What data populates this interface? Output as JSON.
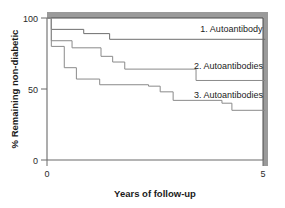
{
  "chart_data": {
    "type": "line",
    "subtype": "kaplan-meier-step",
    "title": "",
    "xlabel": "Years of follow-up",
    "ylabel": "% Remaining non-diabetic",
    "xlim": [
      0,
      5
    ],
    "ylim": [
      0,
      100
    ],
    "xticks": [
      0,
      5
    ],
    "xticklabels": [
      "0",
      "5"
    ],
    "yticks": [
      0,
      50,
      100
    ],
    "yticklabels": [
      "0",
      "50",
      "100"
    ],
    "grid": false,
    "legend_position": "inline-right",
    "series": [
      {
        "name": "1. Autoantibody",
        "label": "1. Autoantibody",
        "color": "#6e6e6e",
        "final_value": 85,
        "steps": [
          {
            "x": 0.0,
            "y": 100
          },
          {
            "x": 0.1,
            "y": 100
          },
          {
            "x": 0.1,
            "y": 92
          },
          {
            "x": 0.85,
            "y": 92
          },
          {
            "x": 0.85,
            "y": 89
          },
          {
            "x": 1.45,
            "y": 89
          },
          {
            "x": 1.45,
            "y": 85
          },
          {
            "x": 5.05,
            "y": 85
          }
        ]
      },
      {
        "name": "2. Autoantibodies",
        "label": "2. Autoantibodies",
        "color": "#8a8a8a",
        "final_value": 56,
        "steps": [
          {
            "x": 0.0,
            "y": 100
          },
          {
            "x": 0.1,
            "y": 100
          },
          {
            "x": 0.1,
            "y": 84
          },
          {
            "x": 0.58,
            "y": 84
          },
          {
            "x": 0.58,
            "y": 79
          },
          {
            "x": 1.25,
            "y": 79
          },
          {
            "x": 1.25,
            "y": 73
          },
          {
            "x": 1.52,
            "y": 73
          },
          {
            "x": 1.52,
            "y": 69
          },
          {
            "x": 1.8,
            "y": 69
          },
          {
            "x": 1.8,
            "y": 64
          },
          {
            "x": 3.45,
            "y": 64
          },
          {
            "x": 3.45,
            "y": 56
          },
          {
            "x": 5.05,
            "y": 56
          }
        ]
      },
      {
        "name": "3. Autoantibodies",
        "label": "3. Autoantibodies",
        "color": "#8a8a8a",
        "final_value": 35,
        "steps": [
          {
            "x": 0.0,
            "y": 100
          },
          {
            "x": 0.1,
            "y": 100
          },
          {
            "x": 0.1,
            "y": 80
          },
          {
            "x": 0.4,
            "y": 80
          },
          {
            "x": 0.4,
            "y": 65
          },
          {
            "x": 0.68,
            "y": 65
          },
          {
            "x": 0.68,
            "y": 57
          },
          {
            "x": 1.22,
            "y": 57
          },
          {
            "x": 1.22,
            "y": 53
          },
          {
            "x": 2.35,
            "y": 53
          },
          {
            "x": 2.35,
            "y": 52
          },
          {
            "x": 2.62,
            "y": 52
          },
          {
            "x": 2.62,
            "y": 48
          },
          {
            "x": 2.92,
            "y": 48
          },
          {
            "x": 2.92,
            "y": 42
          },
          {
            "x": 4.05,
            "y": 42
          },
          {
            "x": 4.05,
            "y": 40
          },
          {
            "x": 4.28,
            "y": 40
          },
          {
            "x": 4.28,
            "y": 35
          },
          {
            "x": 5.05,
            "y": 35
          }
        ]
      }
    ],
    "annotations": [
      {
        "text": "1. Autoantibody",
        "x": 3.55,
        "y": 90
      },
      {
        "text": "2. Autoantibodies",
        "x": 3.4,
        "y": 64
      },
      {
        "text": "3. Autoantibodies",
        "x": 3.4,
        "y": 44
      }
    ]
  },
  "axes": {
    "ylabel": "% Remaining non-diabetic",
    "xlabel": "Years of follow-up",
    "ytick_100": "100",
    "ytick_50": "50",
    "ytick_0": "0",
    "xtick_0": "0",
    "xtick_5": "5"
  },
  "colors": {
    "background": "#ffffff",
    "axis": "#5a5a5a",
    "shadow": "#9a9a9a",
    "text": "#1b1b1b",
    "series1": "#6e6e6e",
    "series2": "#8a8a8a",
    "series3": "#8a8a8a"
  }
}
